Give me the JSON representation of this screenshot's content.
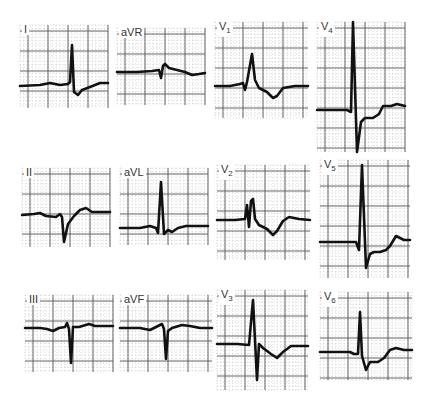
{
  "figure": {
    "type": "12-lead ECG",
    "grid_color": "#555555",
    "trace_color": "#111111",
    "background": "#ffffff"
  },
  "leads": [
    {
      "id": "I",
      "label": "I",
      "sub": "",
      "x": 20,
      "y": 25,
      "w": 88,
      "h": 83,
      "baseline": 61,
      "trace": "0,61 20,60 30,58 40,60 48,59 50,57 52,20 54,67 58,70 62,65 70,62 80,58 88,58"
    },
    {
      "id": "aVR",
      "label": "aVR",
      "sub": "",
      "x": 117,
      "y": 28,
      "w": 88,
      "h": 77,
      "baseline": 44,
      "trace": "0,44 20,44 35,43 42,42 44,50 46,38 48,36 52,40 60,42 68,44 75,47 82,46 88,45"
    },
    {
      "id": "V1",
      "label": "V",
      "sub": "1",
      "x": 215,
      "y": 22,
      "w": 93,
      "h": 96,
      "baseline": 64,
      "trace": "0,64 15,64 25,62 28,61 30,68 32,60 37,32 40,58 44,66 52,70 58,76 62,74 68,66 80,64 93,64"
    },
    {
      "id": "V4",
      "label": "V",
      "sub": "4",
      "x": 317,
      "y": 22,
      "w": 88,
      "h": 130,
      "baseline": 88,
      "trace": "0,88 30,88 34,90 36,0 40,130 44,100 48,96 56,96 62,92 66,84 74,84 80,82 88,84"
    },
    {
      "id": "II",
      "label": "II",
      "sub": "",
      "x": 22,
      "y": 168,
      "w": 88,
      "h": 79,
      "baseline": 47,
      "trace": "0,47 12,46 18,45 24,48 34,49 38,46 40,49 42,74 46,56 52,48 58,42 64,40 70,44 80,44 88,44"
    },
    {
      "id": "aVL",
      "label": "aVL",
      "sub": "",
      "x": 120,
      "y": 168,
      "w": 88,
      "h": 77,
      "baseline": 60,
      "trace": "0,60 20,60 30,58 36,60 38,65 41,14 44,66 48,62 52,64 58,60 66,58 76,58 88,58"
    },
    {
      "id": "V2",
      "label": "V",
      "sub": "2",
      "x": 217,
      "y": 165,
      "w": 93,
      "h": 95,
      "baseline": 55,
      "trace": "0,55 18,55 28,54 30,40 32,62 34,36 36,34 38,54 42,60 50,64 56,70 60,66 66,56 72,52 82,54 93,55"
    },
    {
      "id": "V5",
      "label": "V",
      "sub": "5",
      "x": 320,
      "y": 160,
      "w": 90,
      "h": 118,
      "baseline": 82,
      "trace": "0,82 25,82 36,82 39,90 42,5 46,108 50,94 54,92 60,92 66,90 70,86 76,76 84,80 90,80"
    },
    {
      "id": "III",
      "label": "III",
      "sub": "",
      "x": 25,
      "y": 295,
      "w": 88,
      "h": 77,
      "baseline": 33,
      "trace": "0,33 15,33 22,34 28,36 34,33 40,32 42,28 44,34 46,68 48,32 54,32 64,29 70,31 80,31 88,31"
    },
    {
      "id": "aVF",
      "label": "aVF",
      "sub": "",
      "x": 120,
      "y": 295,
      "w": 92,
      "h": 77,
      "baseline": 33,
      "trace": "0,33 20,33 30,35 38,31 42,29 44,34 46,64 48,36 52,33 62,30 70,31 80,33 92,33"
    },
    {
      "id": "V3",
      "label": "V",
      "sub": "3",
      "x": 217,
      "y": 290,
      "w": 91,
      "h": 100,
      "baseline": 54,
      "trace": "0,54 20,54 32,55 36,10 40,90 42,54 46,58 54,64 60,68 66,62 74,56 84,56 91,56"
    },
    {
      "id": "V6",
      "label": "V",
      "sub": "6",
      "x": 320,
      "y": 292,
      "w": 92,
      "h": 88,
      "baseline": 60,
      "trace": "0,60 20,60 30,60 34,62 38,62 40,20 42,64 46,78 50,70 58,70 64,66 70,58 76,56 84,58 92,58"
    }
  ]
}
